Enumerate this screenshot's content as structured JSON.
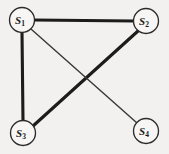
{
  "figure": {
    "kind": "undirected-graph",
    "background_color": "#f2f1ef",
    "width": 169,
    "height": 154
  },
  "graph": {
    "nodes": [
      {
        "id": "S1",
        "label_base": "S",
        "label_sub": "1",
        "cx": 22,
        "cy": 20,
        "r": 12.5
      },
      {
        "id": "S2",
        "label_base": "S",
        "label_sub": "2",
        "cx": 146,
        "cy": 21,
        "r": 12.5
      },
      {
        "id": "S3",
        "label_base": "S",
        "label_sub": "3",
        "cx": 23,
        "cy": 133,
        "r": 12.5
      },
      {
        "id": "S4",
        "label_base": "S",
        "label_sub": "4",
        "cx": 146,
        "cy": 131,
        "r": 12.5
      }
    ],
    "edges": [
      {
        "id": "e-s1-s2",
        "from": "S1",
        "to": "S2",
        "weight": "thick",
        "x1": 34,
        "y1": 20,
        "x2": 134,
        "y2": 21
      },
      {
        "id": "e-s1-s3",
        "from": "S1",
        "to": "S3",
        "weight": "thick",
        "x1": 22,
        "y1": 32,
        "x2": 23,
        "y2": 121
      },
      {
        "id": "e-s3-s2",
        "from": "S3",
        "to": "S2",
        "weight": "thick",
        "x1": 33,
        "y1": 126,
        "x2": 138,
        "y2": 31
      },
      {
        "id": "e-s1-s4",
        "from": "S1",
        "to": "S4",
        "weight": "thin",
        "x1": 31,
        "y1": 29,
        "x2": 137,
        "y2": 123
      }
    ],
    "colors": {
      "edge_thick": "#1c1c1c",
      "edge_thin": "#3a3a3a",
      "node_stroke": "#2b2b2b",
      "node_fill": "#f7f6f4",
      "label": "#1a1a1a"
    }
  }
}
